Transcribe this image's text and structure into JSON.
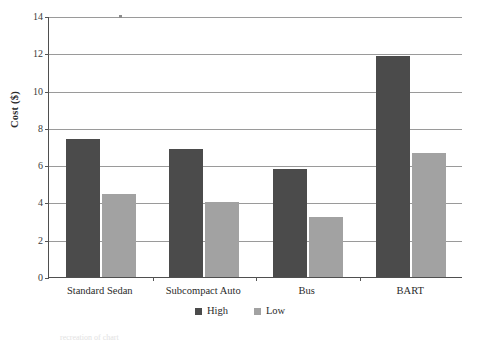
{
  "chart_data": {
    "type": "bar",
    "title": "",
    "subtitle": "",
    "xlabel": "",
    "ylabel": "Cost ($)",
    "categories": [
      "Standard Sedan",
      "Subcompact Auto",
      "Bus",
      "BART"
    ],
    "series": [
      {
        "name": "High",
        "color": "#4b4b4b",
        "values": [
          7.4,
          6.85,
          5.8,
          11.85
        ]
      },
      {
        "name": "Low",
        "color": "#a2a2a2",
        "values": [
          4.45,
          4.0,
          3.2,
          6.65
        ]
      }
    ],
    "ylim": [
      0,
      14
    ],
    "ytick_values": [
      0,
      2,
      4,
      6,
      8,
      10,
      12,
      14
    ],
    "ytick_labels": [
      "0",
      "2",
      "4",
      "6",
      "8",
      "10",
      "12",
      "14"
    ],
    "grid": true,
    "grid_axis": "y",
    "legend": {
      "position": "bottom-center",
      "entries": [
        "High",
        "Low"
      ]
    }
  },
  "artifacts": {
    "bottom_bleed": "recreation of chart"
  }
}
